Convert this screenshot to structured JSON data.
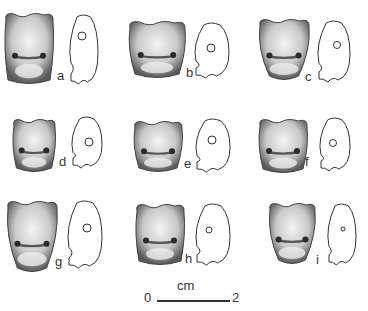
{
  "figure": {
    "specimens": [
      {
        "label": "a",
        "x": 4,
        "y": 12,
        "w": 50,
        "h": 72,
        "shape": "tall",
        "pos_label": [
          57,
          69
        ]
      },
      {
        "label": "b",
        "x": 128,
        "y": 20,
        "w": 58,
        "h": 58,
        "shape": "wide",
        "pos_label": [
          186,
          66
        ]
      },
      {
        "label": "c",
        "x": 258,
        "y": 18,
        "w": 52,
        "h": 62,
        "shape": "taper",
        "pos_label": [
          305,
          70
        ]
      },
      {
        "label": "d",
        "x": 12,
        "y": 118,
        "w": 44,
        "h": 54,
        "shape": "round",
        "pos_label": [
          59,
          155
        ]
      },
      {
        "label": "e",
        "x": 133,
        "y": 120,
        "w": 50,
        "h": 52,
        "shape": "wide",
        "pos_label": [
          184,
          157
        ]
      },
      {
        "label": "f",
        "x": 258,
        "y": 118,
        "w": 50,
        "h": 55,
        "shape": "round",
        "pos_label": [
          305,
          155
        ]
      },
      {
        "label": "g",
        "x": 6,
        "y": 200,
        "w": 52,
        "h": 72,
        "shape": "taper",
        "pos_label": [
          55,
          255
        ]
      },
      {
        "label": "h",
        "x": 135,
        "y": 203,
        "w": 50,
        "h": 62,
        "shape": "tall",
        "pos_label": [
          185,
          252
        ]
      },
      {
        "label": "i",
        "x": 268,
        "y": 202,
        "w": 48,
        "h": 62,
        "shape": "taper",
        "pos_label": [
          316,
          253
        ]
      }
    ],
    "outlines": [
      {
        "for": "a",
        "x": 68,
        "y": 14,
        "w": 30,
        "h": 70,
        "hole": [
          82,
          36,
          4
        ]
      },
      {
        "for": "b",
        "x": 193,
        "y": 22,
        "w": 36,
        "h": 56,
        "hole": [
          211,
          48,
          4
        ]
      },
      {
        "for": "c",
        "x": 316,
        "y": 20,
        "w": 34,
        "h": 62,
        "hole": [
          337,
          45,
          3.5
        ]
      },
      {
        "for": "d",
        "x": 70,
        "y": 116,
        "w": 32,
        "h": 52,
        "hole": [
          89,
          142,
          4
        ]
      },
      {
        "for": "e",
        "x": 194,
        "y": 118,
        "w": 36,
        "h": 54,
        "hole": [
          212,
          140,
          4
        ]
      },
      {
        "for": "f",
        "x": 318,
        "y": 117,
        "w": 32,
        "h": 54,
        "hole": [
          333,
          143,
          3.5
        ]
      },
      {
        "for": "g",
        "x": 66,
        "y": 200,
        "w": 36,
        "h": 68,
        "hole": [
          87,
          228,
          4
        ]
      },
      {
        "for": "h",
        "x": 194,
        "y": 203,
        "w": 36,
        "h": 62,
        "hole": [
          209,
          230,
          3
        ]
      },
      {
        "for": "i",
        "x": 326,
        "y": 203,
        "w": 30,
        "h": 62,
        "hole": [
          343,
          229,
          2
        ]
      }
    ],
    "scale_bar": {
      "start": "0",
      "end": "2",
      "unit": "cm"
    }
  },
  "colors": {
    "ink": "#333333",
    "shade_dark": "#6a6a6a",
    "shade_light": "#e8e8e8",
    "background": "#ffffff"
  }
}
